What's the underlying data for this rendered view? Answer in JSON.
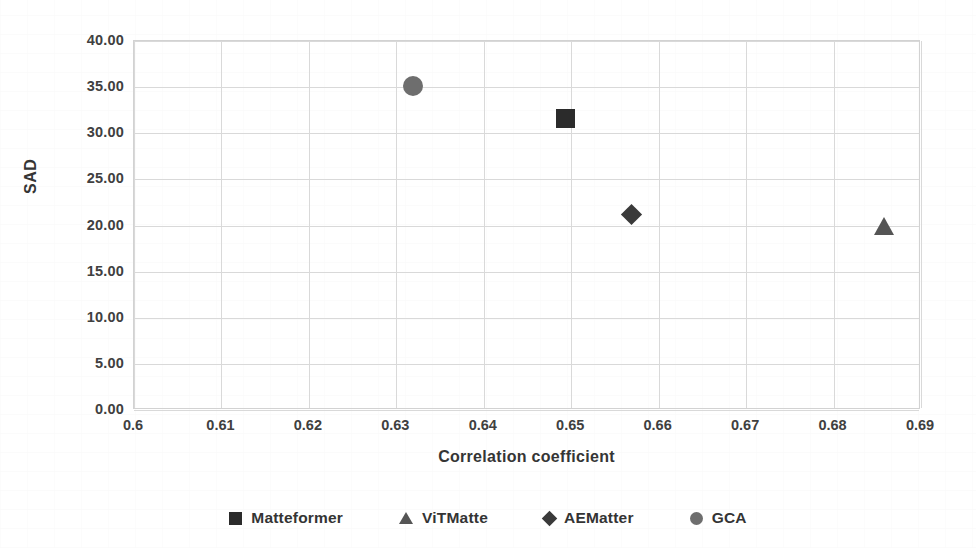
{
  "chart_data": {
    "type": "scatter",
    "title": "",
    "xlabel": "Correlation coefficient",
    "ylabel": "SAD",
    "xlim": [
      0.6,
      0.69
    ],
    "ylim": [
      0.0,
      40.0
    ],
    "grid": true,
    "legend_position": "bottom",
    "xticks": [
      "0.6",
      "0.61",
      "0.62",
      "0.63",
      "0.64",
      "0.65",
      "0.66",
      "0.67",
      "0.68",
      "0.69"
    ],
    "xtick_values": [
      0.6,
      0.61,
      0.62,
      0.63,
      0.64,
      0.65,
      0.66,
      0.67,
      0.68,
      0.69
    ],
    "yticks": [
      "0.00",
      "5.00",
      "10.00",
      "15.00",
      "20.00",
      "25.00",
      "30.00",
      "35.00",
      "40.00"
    ],
    "ytick_values": [
      0,
      5,
      10,
      15,
      20,
      25,
      30,
      35,
      40
    ],
    "series": [
      {
        "name": "Matteformer",
        "marker": "square",
        "color": "#2b2b2b",
        "points": [
          {
            "x": 0.6494,
            "y": 31.6
          }
        ]
      },
      {
        "name": "ViTMatte",
        "marker": "triangle",
        "color": "#555555",
        "points": [
          {
            "x": 0.6858,
            "y": 19.8
          }
        ]
      },
      {
        "name": "AEMatter",
        "marker": "diamond",
        "color": "#3a3a3a",
        "points": [
          {
            "x": 0.6569,
            "y": 21.2
          }
        ]
      },
      {
        "name": "GCA",
        "marker": "circle",
        "color": "#6e6e6e",
        "points": [
          {
            "x": 0.6319,
            "y": 35.1
          }
        ]
      }
    ]
  },
  "legend": {
    "items": [
      {
        "label": "Matteformer",
        "marker": "square",
        "icon": "square-marker-icon"
      },
      {
        "label": "ViTMatte",
        "marker": "triangle",
        "icon": "triangle-marker-icon"
      },
      {
        "label": "AEMatter",
        "marker": "diamond",
        "icon": "diamond-marker-icon"
      },
      {
        "label": "GCA",
        "marker": "circle",
        "icon": "circle-marker-icon"
      }
    ]
  }
}
